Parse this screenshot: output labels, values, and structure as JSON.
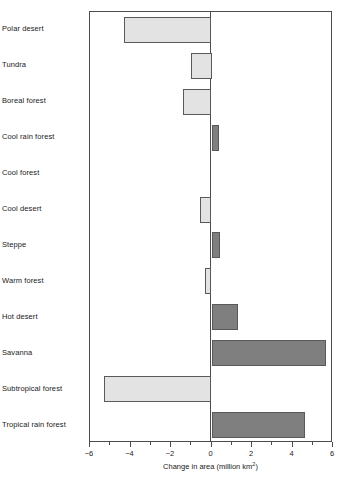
{
  "chart_data": {
    "type": "bar",
    "orientation": "horizontal",
    "title": "",
    "xlabel": "Change in area (million km2)",
    "xlabel_base": "Change in area (million km",
    "xlabel_exponent": "2",
    "xlabel_suffix": ")",
    "ylabel": "",
    "xlim": [
      -6,
      6
    ],
    "grid": false,
    "legend": "none",
    "xticks": [
      -6,
      -4,
      -2,
      0,
      2,
      4,
      6
    ],
    "xtick_labels": [
      "−6",
      "−4",
      "−2",
      "0",
      "2",
      "4",
      "6"
    ],
    "minor_tick_step": 1,
    "categories": [
      "Polar desert",
      "Tundra",
      "Boreal forest",
      "Cool rain forest",
      "Cool forest",
      "Cool desert",
      "Steppe",
      "Warm forest",
      "Hot desert",
      "Savanna",
      "Subtropical forest",
      "Tropical rain forest"
    ],
    "values": [
      -4.3,
      -1.0,
      -1.4,
      0.35,
      0.0,
      -0.55,
      0.4,
      -0.3,
      1.3,
      5.65,
      -5.3,
      4.6
    ],
    "colors": {
      "increase": "#7f7f7f",
      "decrease": "#e3e3e3",
      "bar_border": "#595959",
      "axis": "#4d4d4d",
      "background": "#ffffff",
      "text": "#1a1a1a"
    }
  }
}
